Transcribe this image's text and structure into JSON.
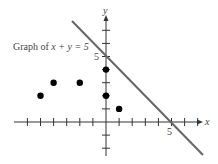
{
  "figure": {
    "caption_prefix": "Graph of ",
    "caption_equation": "x + y = 5",
    "x_axis_label": "x",
    "y_axis_label": "y",
    "x_intercept_label": "5",
    "y_intercept_label": "5"
  },
  "chart_data": {
    "type": "scatter",
    "title": "Graph of x + y = 5",
    "xlabel": "x",
    "ylabel": "y",
    "xlim": [
      -7,
      7
    ],
    "ylim": [
      -3,
      7
    ],
    "tick_step": 1,
    "grid": false,
    "line": {
      "equation": "x + y = 5",
      "intercepts": [
        [
          5,
          0
        ],
        [
          0,
          5
        ]
      ]
    },
    "points": [
      {
        "x": -5,
        "y": 2
      },
      {
        "x": -4,
        "y": 3
      },
      {
        "x": -2,
        "y": 3
      },
      {
        "x": 0,
        "y": 4
      },
      {
        "x": 0,
        "y": 2
      },
      {
        "x": 1,
        "y": 1
      }
    ],
    "colors": {
      "axes": "#333333",
      "line": "#666666",
      "points": "#000000"
    }
  }
}
